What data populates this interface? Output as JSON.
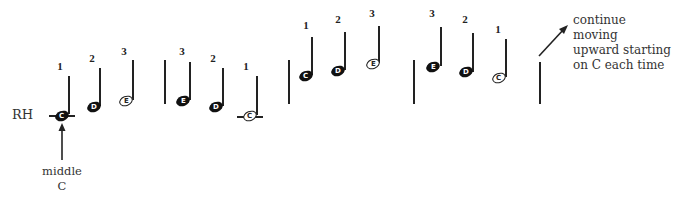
{
  "top_text_cut": "",
  "hand_label": "RH",
  "middle_c_label": {
    "line1": "middle",
    "line2": "C"
  },
  "continue_text": {
    "line1": "continue moving",
    "line2": "upward starting",
    "line3": "on C each time"
  },
  "groups": [
    {
      "name": "group-1-ascending-middle-c",
      "notes": [
        {
          "letter": "C",
          "finger": "1",
          "style": "filled",
          "ledger": true
        },
        {
          "letter": "D",
          "finger": "2",
          "style": "filled",
          "ledger": false
        },
        {
          "letter": "E",
          "finger": "3",
          "style": "open",
          "ledger": false
        }
      ]
    },
    {
      "name": "group-2-descending-middle-c",
      "notes": [
        {
          "letter": "E",
          "finger": "3",
          "style": "filled",
          "ledger": false
        },
        {
          "letter": "D",
          "finger": "2",
          "style": "filled",
          "ledger": false
        },
        {
          "letter": "C",
          "finger": "1",
          "style": "open",
          "ledger": true
        }
      ]
    },
    {
      "name": "group-3-ascending-octave-up",
      "notes": [
        {
          "letter": "C",
          "finger": "1",
          "style": "filled",
          "ledger": false
        },
        {
          "letter": "D",
          "finger": "2",
          "style": "filled",
          "ledger": false
        },
        {
          "letter": "E",
          "finger": "3",
          "style": "open",
          "ledger": false
        }
      ]
    },
    {
      "name": "group-4-descending-octave-up",
      "notes": [
        {
          "letter": "E",
          "finger": "3",
          "style": "filled",
          "ledger": false
        },
        {
          "letter": "D",
          "finger": "2",
          "style": "filled",
          "ledger": false
        },
        {
          "letter": "C",
          "finger": "1",
          "style": "open",
          "ledger": false
        }
      ]
    }
  ]
}
